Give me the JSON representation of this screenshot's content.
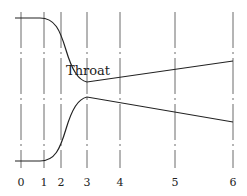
{
  "diagram": {
    "type": "nozzle-cross-section",
    "annotation": "Throat",
    "stations": [
      {
        "label": "0"
      },
      {
        "label": "1"
      },
      {
        "label": "2"
      },
      {
        "label": "3"
      },
      {
        "label": "4"
      },
      {
        "label": "5"
      },
      {
        "label": "6"
      }
    ],
    "throat_station": "3"
  }
}
